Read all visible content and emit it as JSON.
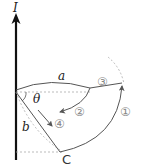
{
  "figure": {
    "current_label": "I",
    "distance_a_label": "a",
    "distance_b_label": "b",
    "angle_label": "θ",
    "point_label": "C",
    "paths": [
      {
        "id": 1,
        "label": "①"
      },
      {
        "id": 2,
        "label": "②"
      },
      {
        "id": 3,
        "label": "③"
      },
      {
        "id": 4,
        "label": "④"
      }
    ]
  },
  "colors": {
    "wire": "#111111",
    "path": "#555555",
    "dashed": "#aaaaaa"
  }
}
